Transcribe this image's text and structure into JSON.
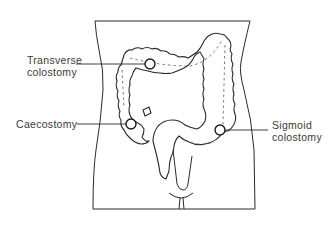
{
  "diagram": {
    "labels": {
      "transverse": {
        "line1": "Transverse",
        "line2": "colostomy"
      },
      "caecostomy": {
        "line1": "Caecostomy"
      },
      "sigmoid": {
        "line1": "Sigmoid",
        "line2": "colostomy"
      }
    },
    "stoma_sites": [
      {
        "name": "Transverse colostomy",
        "x": 150,
        "y": 64
      },
      {
        "name": "Caecostomy",
        "x": 131,
        "y": 124
      },
      {
        "name": "Sigmoid colostomy",
        "x": 220,
        "y": 130
      }
    ],
    "colors": {
      "line": "#2a2a2a",
      "text": "#3a3a3a",
      "background": "#ffffff"
    }
  }
}
